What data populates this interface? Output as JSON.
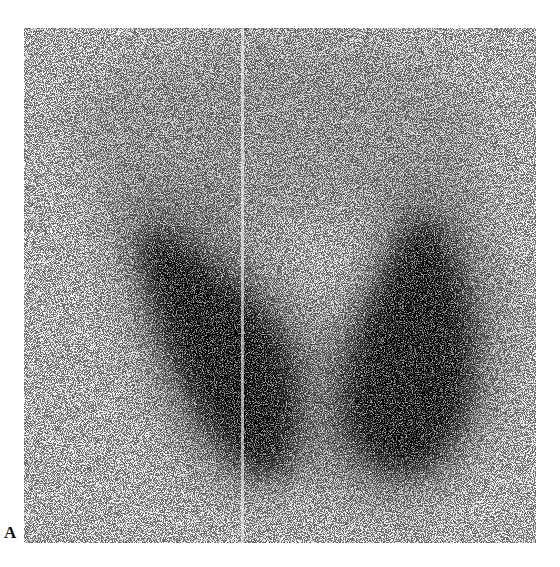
{
  "figure": {
    "panel_label": "A",
    "image": {
      "subject": "thyroid-scintigram",
      "background_color": "#f1f1f1",
      "uptake_color": "#000000",
      "regions": [
        {
          "name": "right-lobe-left-side",
          "apex": [
            120,
            165
          ],
          "base": [
            270,
            490
          ]
        },
        {
          "name": "left-lobe-right-side",
          "apex": [
            425,
            170
          ],
          "base": [
            390,
            490
          ]
        },
        {
          "name": "isthmus",
          "center": [
            300,
            410
          ]
        }
      ]
    }
  }
}
